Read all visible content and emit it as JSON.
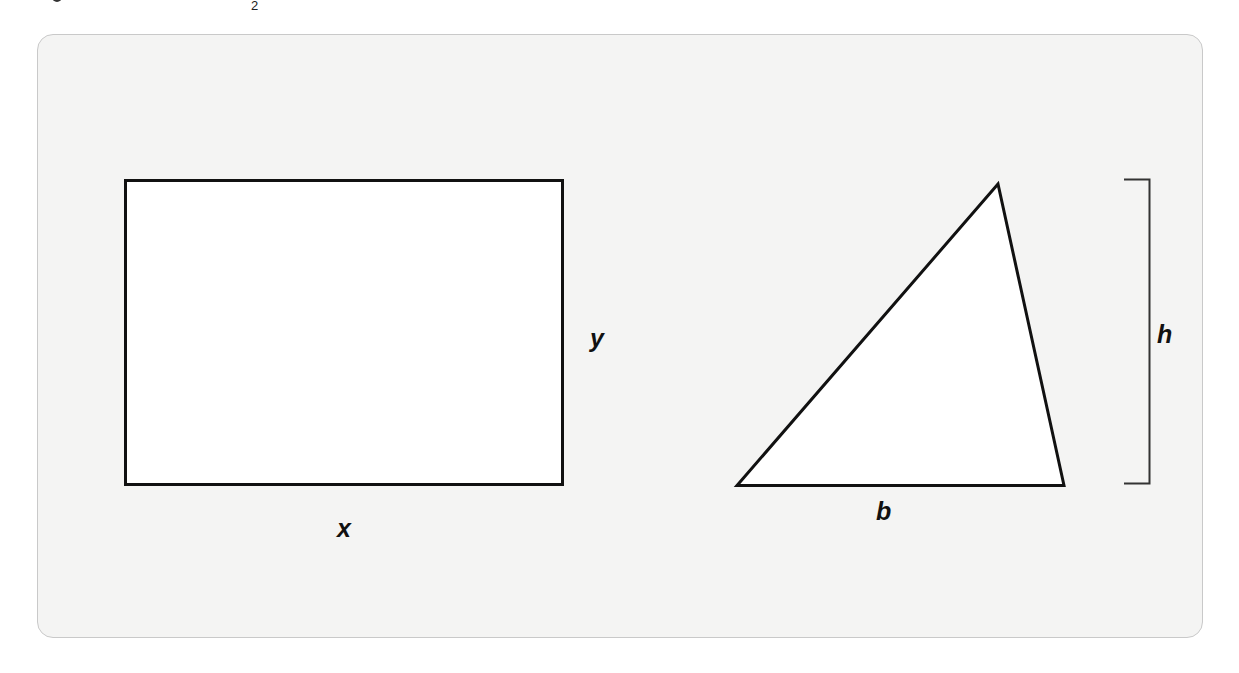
{
  "header_fragment": {
    "subscript": "2"
  },
  "figure": {
    "rectangle": {
      "width_label": "x",
      "height_label": "y"
    },
    "triangle": {
      "base_label": "b",
      "height_label": "h"
    },
    "colors": {
      "panel_background": "#f4f4f3",
      "panel_border": "#c9c9c9",
      "stroke": "#111111"
    }
  }
}
